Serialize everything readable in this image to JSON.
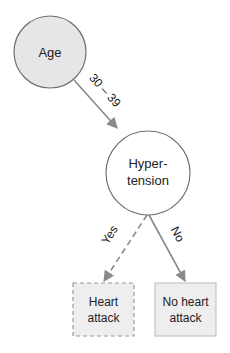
{
  "diagram": {
    "type": "decision-tree",
    "colors": {
      "edge": "#8a8a8a",
      "node_stroke": "#707070",
      "root_fill": "#e6e6e6",
      "internal_fill": "#ffffff",
      "leaf_fill": "#eeeeee",
      "leaf_stroke": "#9a9a9a",
      "text": "#222222"
    },
    "nodes": {
      "root": {
        "label": "Age"
      },
      "internal": {
        "line1": "Hyper-",
        "line2": "tension"
      },
      "leaf_yes": {
        "line1": "Heart",
        "line2": "attack",
        "style": "dashed"
      },
      "leaf_no": {
        "line1": "No heart",
        "line2": "attack",
        "style": "solid"
      }
    },
    "edges": {
      "root_to_internal": {
        "label": "30 – 39"
      },
      "internal_to_yes": {
        "label": "Yes",
        "style": "dashed"
      },
      "internal_to_no": {
        "label": "No",
        "style": "solid"
      }
    }
  }
}
